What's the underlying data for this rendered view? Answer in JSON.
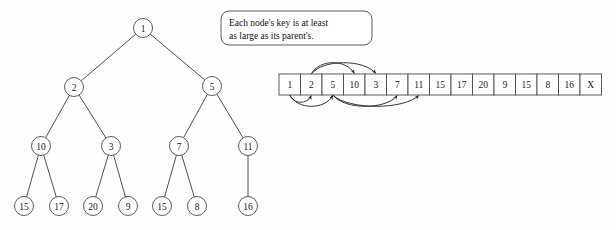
{
  "figure": {
    "background_color": "#fefefe",
    "line_color": "#4a4a4a",
    "text_color": "#1a1a1a"
  },
  "callout": {
    "line1": "Each node's key is at least",
    "line2": "as large as its parent's."
  },
  "tree": {
    "nodes": [
      {
        "id": "n1",
        "label": "1",
        "cx": 143,
        "cy": 28,
        "r": 9.5
      },
      {
        "id": "n2",
        "label": "2",
        "cx": 74,
        "cy": 87,
        "r": 9.5
      },
      {
        "id": "n3",
        "label": "5",
        "cx": 212,
        "cy": 86,
        "r": 9.5
      },
      {
        "id": "n4",
        "label": "10",
        "cx": 41,
        "cy": 146,
        "r": 9.5
      },
      {
        "id": "n5",
        "label": "3",
        "cx": 111,
        "cy": 146,
        "r": 9.5
      },
      {
        "id": "n6",
        "label": "7",
        "cx": 179,
        "cy": 146,
        "r": 9.5
      },
      {
        "id": "n7",
        "label": "11",
        "cx": 248,
        "cy": 146,
        "r": 9.5
      },
      {
        "id": "n8",
        "label": "15",
        "cx": 24,
        "cy": 206,
        "r": 9.5
      },
      {
        "id": "n9",
        "label": "17",
        "cx": 59,
        "cy": 206,
        "r": 9.5
      },
      {
        "id": "n10",
        "label": "20",
        "cx": 93,
        "cy": 206,
        "r": 9.5
      },
      {
        "id": "n11",
        "label": "9",
        "cx": 128,
        "cy": 206,
        "r": 9.5
      },
      {
        "id": "n12",
        "label": "15",
        "cx": 162,
        "cy": 206,
        "r": 9.5
      },
      {
        "id": "n13",
        "label": "8",
        "cx": 197,
        "cy": 206,
        "r": 9.5
      },
      {
        "id": "n14",
        "label": "16",
        "cx": 248,
        "cy": 206,
        "r": 9.5
      }
    ],
    "edges": [
      {
        "from": "n1",
        "to": "n2"
      },
      {
        "from": "n1",
        "to": "n3"
      },
      {
        "from": "n2",
        "to": "n4"
      },
      {
        "from": "n2",
        "to": "n5"
      },
      {
        "from": "n3",
        "to": "n6"
      },
      {
        "from": "n3",
        "to": "n7"
      },
      {
        "from": "n4",
        "to": "n8"
      },
      {
        "from": "n4",
        "to": "n9"
      },
      {
        "from": "n5",
        "to": "n10"
      },
      {
        "from": "n5",
        "to": "n11"
      },
      {
        "from": "n6",
        "to": "n12"
      },
      {
        "from": "n6",
        "to": "n13"
      },
      {
        "from": "n7",
        "to": "n14"
      }
    ]
  },
  "array": {
    "x": 279,
    "y": 74,
    "cell_width": 21.5,
    "cell_height": 21,
    "cells": [
      "1",
      "2",
      "5",
      "10",
      "3",
      "7",
      "11",
      "15",
      "17",
      "20",
      "9",
      "15",
      "8",
      "16",
      "X"
    ],
    "arcs_above": [
      {
        "from_index": 1,
        "to_index": 3
      },
      {
        "from_index": 1,
        "to_index": 4
      }
    ],
    "arcs_below": [
      {
        "from_index": 0,
        "to_index": 1
      },
      {
        "from_index": 0,
        "to_index": 2
      },
      {
        "from_index": 2,
        "to_index": 5
      },
      {
        "from_index": 2,
        "to_index": 6
      }
    ]
  }
}
